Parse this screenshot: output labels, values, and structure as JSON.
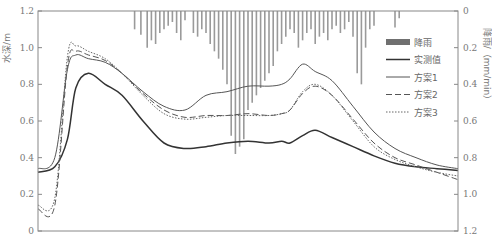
{
  "chart_data": {
    "type": "line",
    "title": "",
    "xlabel": "",
    "ylabel": "水深/m",
    "y2label": "降雨/（mm/min）",
    "ylim": [
      0,
      1.2
    ],
    "y2lim": [
      1.2,
      0
    ],
    "y2_inverted": true,
    "grid": false,
    "legend_position": "right-inside",
    "yticks": [
      "0",
      "0.2",
      "0.4",
      "0.6",
      "0.8",
      "1.0",
      "1.2"
    ],
    "y2ticks": [
      "0",
      "0.2",
      "0.4",
      "0.6",
      "0.8",
      "1.0",
      "1.2"
    ],
    "legend": [
      {
        "key": "rain",
        "label": "降雨",
        "style": "bar"
      },
      {
        "key": "measured",
        "label": "实测值",
        "style": "solid-thick"
      },
      {
        "key": "s1",
        "label": "方案1",
        "style": "solid-thin"
      },
      {
        "key": "s2",
        "label": "方案2",
        "style": "dashed"
      },
      {
        "key": "s3",
        "label": "方案3",
        "style": "dotted"
      }
    ],
    "x_normalized": [
      0,
      0.04,
      0.07,
      0.09,
      0.12,
      0.16,
      0.2,
      0.25,
      0.3,
      0.35,
      0.4,
      0.45,
      0.5,
      0.55,
      0.58,
      0.6,
      0.63,
      0.66,
      0.7,
      0.75,
      0.8,
      0.85,
      0.9,
      0.95,
      1.0
    ],
    "series": [
      {
        "name": "实测值",
        "values": [
          0.32,
          0.35,
          0.5,
          0.78,
          0.86,
          0.8,
          0.74,
          0.6,
          0.48,
          0.45,
          0.46,
          0.48,
          0.49,
          0.48,
          0.49,
          0.48,
          0.52,
          0.55,
          0.51,
          0.46,
          0.41,
          0.37,
          0.35,
          0.34,
          0.33
        ]
      },
      {
        "name": "方案1",
        "values": [
          0.34,
          0.4,
          0.88,
          0.96,
          0.94,
          0.92,
          0.86,
          0.76,
          0.68,
          0.66,
          0.74,
          0.76,
          0.79,
          0.79,
          0.8,
          0.83,
          0.91,
          0.87,
          0.82,
          0.68,
          0.54,
          0.45,
          0.4,
          0.36,
          0.34
        ]
      },
      {
        "name": "方案2",
        "values": [
          0.12,
          0.14,
          0.9,
          0.98,
          0.96,
          0.93,
          0.86,
          0.75,
          0.66,
          0.62,
          0.63,
          0.63,
          0.64,
          0.63,
          0.64,
          0.66,
          0.75,
          0.79,
          0.74,
          0.61,
          0.48,
          0.4,
          0.36,
          0.32,
          0.28
        ]
      },
      {
        "name": "方案3",
        "values": [
          0.14,
          0.18,
          0.95,
          1.01,
          0.98,
          0.94,
          0.86,
          0.74,
          0.64,
          0.61,
          0.62,
          0.63,
          0.63,
          0.63,
          0.64,
          0.66,
          0.76,
          0.8,
          0.74,
          0.6,
          0.46,
          0.39,
          0.35,
          0.32,
          0.3
        ]
      }
    ],
    "rainfall_mm_per_min": {
      "x_normalized": [
        0.23,
        0.245,
        0.26,
        0.27,
        0.28,
        0.29,
        0.3,
        0.31,
        0.32,
        0.33,
        0.34,
        0.35,
        0.37,
        0.38,
        0.39,
        0.4,
        0.41,
        0.42,
        0.43,
        0.44,
        0.45,
        0.46,
        0.47,
        0.48,
        0.49,
        0.5,
        0.51,
        0.52,
        0.53,
        0.54,
        0.55,
        0.56,
        0.57,
        0.58,
        0.59,
        0.6,
        0.61,
        0.62,
        0.63,
        0.64,
        0.65,
        0.66,
        0.67,
        0.68,
        0.69,
        0.7,
        0.71,
        0.72,
        0.73,
        0.74,
        0.75,
        0.76,
        0.77,
        0.78,
        0.79,
        0.8,
        0.85,
        0.86
      ],
      "values": [
        0.1,
        0.13,
        0.2,
        0.16,
        0.18,
        0.12,
        0.1,
        0.08,
        0.06,
        0.12,
        0.16,
        0.05,
        0.12,
        0.14,
        0.1,
        0.12,
        0.18,
        0.22,
        0.26,
        0.32,
        0.4,
        0.68,
        0.78,
        0.74,
        0.7,
        0.54,
        0.5,
        0.46,
        0.42,
        0.38,
        0.34,
        0.3,
        0.22,
        0.18,
        0.14,
        0.1,
        0.12,
        0.2,
        0.16,
        0.12,
        0.1,
        0.18,
        0.14,
        0.12,
        0.16,
        0.1,
        0.08,
        0.12,
        0.1,
        0.06,
        0.14,
        0.34,
        0.4,
        0.2,
        0.1,
        0.08,
        0.09,
        0.04
      ]
    }
  }
}
